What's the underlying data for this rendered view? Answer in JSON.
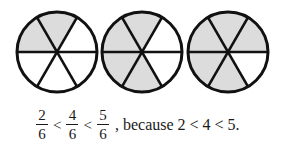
{
  "diagram": {
    "type": "fraction-circles",
    "parts_per_circle": 6,
    "shade_color": "#dcdcdc",
    "outline_color": "#111111",
    "circles": [
      {
        "shaded_parts": 2,
        "shaded_sectors": [
          "top",
          "upper-left"
        ]
      },
      {
        "shaded_parts": 4,
        "shaded_sectors": [
          "top",
          "upper-left",
          "lower-left",
          "bottom"
        ]
      },
      {
        "shaded_parts": 5,
        "shaded_sectors": [
          "top",
          "upper-left",
          "lower-left",
          "bottom",
          "upper-right"
        ]
      }
    ]
  },
  "caption": {
    "fractions": [
      {
        "numerator": "2",
        "denominator": "6"
      },
      {
        "numerator": "4",
        "denominator": "6"
      },
      {
        "numerator": "5",
        "denominator": "6"
      }
    ],
    "operator": "<",
    "tail": ", because 2 < 4 < 5."
  }
}
